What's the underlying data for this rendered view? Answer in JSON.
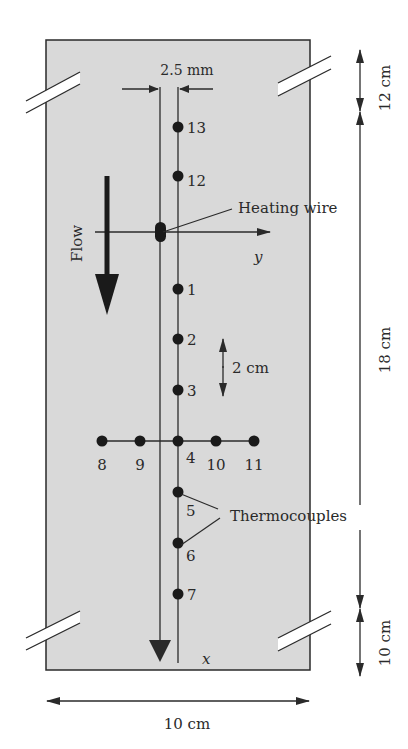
{
  "diagram": {
    "colors": {
      "plate_fill": "#d9d9d9",
      "line": "#2a2a2a",
      "background": "#ffffff"
    },
    "labels": {
      "wire_spacing": "2.5 mm",
      "heating_wire": "Heating wire",
      "flow": "Flow",
      "y_axis": "y",
      "x_axis": "x",
      "spacing": "2 cm",
      "thermocouples": "Thermocouples",
      "dim_top": "12 cm",
      "dim_middle": "18 cm",
      "dim_bottom": "10 cm",
      "dim_width": "10 cm"
    },
    "thermocouples_vertical": [
      {
        "id": "13",
        "x": 178,
        "y": 127
      },
      {
        "id": "12",
        "x": 178,
        "y": 176
      },
      {
        "id": "1",
        "x": 178,
        "y": 289
      },
      {
        "id": "2",
        "x": 178,
        "y": 339
      },
      {
        "id": "3",
        "x": 178,
        "y": 390
      },
      {
        "id": "4",
        "x": 178,
        "y": 441
      },
      {
        "id": "5",
        "x": 178,
        "y": 492
      },
      {
        "id": "6",
        "x": 178,
        "y": 543
      },
      {
        "id": "7",
        "x": 178,
        "y": 594
      }
    ],
    "thermocouples_horizontal": [
      {
        "id": "8",
        "x": 102,
        "y": 441
      },
      {
        "id": "9",
        "x": 140,
        "y": 441
      },
      {
        "id": "10",
        "x": 216,
        "y": 441
      },
      {
        "id": "11",
        "x": 254,
        "y": 441
      }
    ]
  }
}
